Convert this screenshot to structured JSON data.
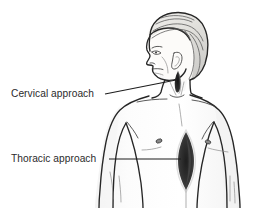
{
  "figure": {
    "background_color": "#ffffff",
    "width": 271,
    "height": 208
  },
  "annotations": [
    {
      "id": "cervical",
      "label": "Cervical approach",
      "label_x": 11,
      "label_y": 97,
      "leader_from_x": 105,
      "leader_from_y": 94,
      "leader_to_x": 176,
      "leader_to_y": 81,
      "target": "neck-base-incision"
    },
    {
      "id": "thoracic",
      "label": "Thoracic approach",
      "label_x": 11,
      "label_y": 162,
      "leader_from_x": 109,
      "leader_from_y": 159,
      "leader_to_x": 180,
      "leader_to_y": 159,
      "target": "sternal-incision"
    }
  ],
  "incisions": [
    {
      "id": "cervical-incision",
      "name": "cervical incision mark",
      "color": "#2a2a2a",
      "shape": "short vertical wedge",
      "center_x": 178,
      "center_y": 80
    },
    {
      "id": "thoracic-incision",
      "name": "thoracic sternotomy incision mark",
      "color": "#3a3a3a",
      "shape": "vertical lens",
      "center_x": 186,
      "center_y": 160
    }
  ],
  "anatomy_marks": [
    {
      "id": "nipple-left",
      "name": "nipple",
      "cx": 159,
      "cy": 141
    },
    {
      "id": "nipple-right",
      "name": "nipple",
      "cx": 208,
      "cy": 142
    }
  ],
  "colors": {
    "outline": "#262626",
    "skin": "#fdfdfd",
    "soft_line": "#3d3d3d",
    "faint_line": "#8d8d8d",
    "hair": "#555555",
    "text": "#2b2b2b",
    "incision_dark": "#2a2a2a"
  }
}
